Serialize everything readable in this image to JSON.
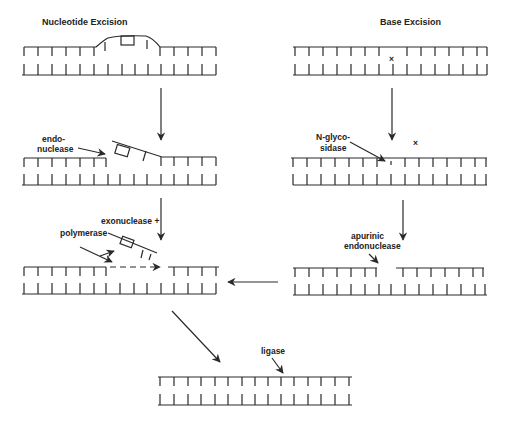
{
  "diagram": {
    "left_panel": {
      "title": "Nucleotide Excision",
      "labels": {
        "endonuclease_line1": "endo-",
        "endonuclease_line2": "nuclease",
        "exonuclease": "exonuclease +",
        "polymerase": "polymerase"
      }
    },
    "right_panel": {
      "title": "Base Excision",
      "damage_mark": "×",
      "labels": {
        "glycosidase_line1": "N-glyco-",
        "glycosidase_line2": "sidase",
        "ap_line1": "apurinic",
        "ap_line2": "endonuclease"
      }
    },
    "final": {
      "label": "ligase"
    },
    "colors": {
      "ink": "#2a2a2a",
      "background": "#ffffff"
    }
  }
}
